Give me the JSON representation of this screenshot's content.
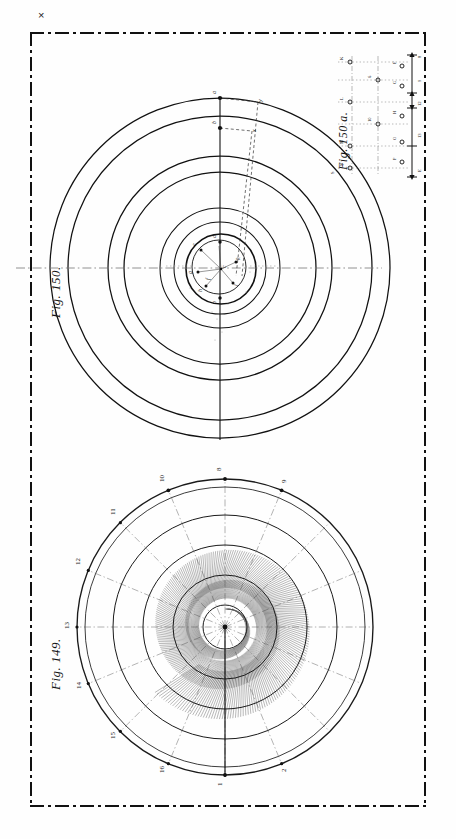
{
  "plate": {
    "caption": "Plate XXVI.",
    "registration_mark": "×",
    "border_style": "dash-dot",
    "background_color": "#fefefe",
    "ink_color": "#111111"
  },
  "figures": [
    {
      "id": "fig-149",
      "caption": "Fig. 149.",
      "type": "polar-clock-diagram",
      "description": "Concentric circles with radial dash-dot hour lines and dense hatched spiral shading",
      "ring_count": 5,
      "radial_divisions": 16,
      "hour_labels": [
        "8",
        "9",
        "10",
        "11",
        "12",
        "13",
        "14",
        "15",
        "16",
        "1",
        "2",
        "3",
        "4",
        "5",
        "6",
        "7"
      ],
      "visible_edge_labels": [
        "8",
        "9",
        "10",
        "11",
        "12",
        "13",
        "14",
        "15",
        "16",
        "1",
        "2"
      ]
    },
    {
      "id": "fig-150",
      "caption": "Fig. 150.",
      "type": "concentric-circle-diagram",
      "description": "Large concentric circles with vertical axis, centre detail and small lettered construction points",
      "outer_ring_count": 4,
      "inner_ring_count": 3,
      "axis_labels": [
        "x",
        "y"
      ],
      "point_labels": [
        "a",
        "b",
        "c",
        "d",
        "e",
        "f",
        "g",
        "h",
        "k",
        "l",
        "m",
        "n",
        "o",
        "p"
      ]
    },
    {
      "id": "fig-150a",
      "caption": "Fig. 150 a.",
      "type": "inset-detail-table",
      "description": "Small inset of lettered points on dotted construction lines with a vertical scale bar",
      "scale_labels": [
        "E",
        "F",
        "G",
        "H",
        "K",
        "L",
        "M",
        "N",
        "O",
        "P"
      ],
      "value_labels": [
        "5",
        "6",
        "8",
        "9",
        "10",
        "11",
        "12",
        "13",
        "18"
      ]
    }
  ],
  "chart_data": {
    "type": "line",
    "xlabel": "",
    "ylabel": "",
    "figures": [
      {
        "name": "Fig. 149.",
        "plot": "polar",
        "center": [
          165,
          172
        ],
        "ring_radii": [
          22,
          52,
          82,
          112,
          140,
          148
        ],
        "radial_count": 16,
        "angle_labels": [
          "8",
          "9",
          "10",
          "11",
          "12",
          "13",
          "14",
          "15",
          "16",
          "1",
          "2",
          "3",
          "4",
          "5",
          "6",
          "7"
        ],
        "hatch_band": {
          "r_inner": 18,
          "r_outer": 96,
          "turns": 2.6
        }
      },
      {
        "name": "Fig. 150.",
        "plot": "concentric",
        "center": [
          150,
          232
        ],
        "ring_radii": [
          26,
          34,
          45,
          60,
          96,
          112,
          152,
          170
        ],
        "axis": "vertical",
        "labels": [
          "a",
          "b",
          "x",
          "y"
        ]
      },
      {
        "name": "Fig. 150 a.",
        "plot": "inset",
        "columns": 4,
        "rows": 6
      }
    ],
    "legend": "none",
    "grid": false
  }
}
